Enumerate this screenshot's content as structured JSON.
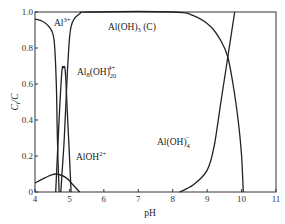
{
  "chart_data": {
    "type": "line",
    "title": "",
    "xlabel": "pH",
    "ylabel": "C_i / C",
    "xlim": [
      4,
      11
    ],
    "ylim": [
      0,
      1.0
    ],
    "x_ticks": [
      "4",
      "5",
      "6",
      "7",
      "8",
      "9",
      "10",
      "11"
    ],
    "y_ticks": [
      "0",
      "0.2",
      "0.4",
      "0.6",
      "0.8",
      "1.0"
    ],
    "grid": false,
    "legend": "none (inline curve labels)",
    "series": [
      {
        "name": "Al3+",
        "label_base": "Al",
        "label_sup": "3+",
        "points": [
          [
            4.0,
            0.96
          ],
          [
            4.2,
            0.95
          ],
          [
            4.4,
            0.92
          ],
          [
            4.55,
            0.85
          ],
          [
            4.62,
            0.6
          ],
          [
            4.65,
            0.3
          ],
          [
            4.7,
            0.0
          ]
        ]
      },
      {
        "name": "Al8(OH)20 4+",
        "label_base": "Al",
        "label_sub1": "8",
        "label_mid": "(OH)",
        "label_sub2": "20",
        "label_sup": "4+",
        "points": [
          [
            4.6,
            0.0
          ],
          [
            4.7,
            0.4
          ],
          [
            4.78,
            0.67
          ],
          [
            4.83,
            0.69
          ],
          [
            4.88,
            0.67
          ],
          [
            4.95,
            0.4
          ],
          [
            5.05,
            0.0
          ]
        ]
      },
      {
        "name": "AlOH2+",
        "label_base": "AlOH",
        "label_sup": "2+",
        "points": [
          [
            4.0,
            0.05
          ],
          [
            4.3,
            0.08
          ],
          [
            4.6,
            0.1
          ],
          [
            4.9,
            0.08
          ],
          [
            5.1,
            0.04
          ],
          [
            5.3,
            0.0
          ]
        ]
      },
      {
        "name": "Al(OH)3 (C)",
        "label_base": "Al(OH)",
        "label_sub": "3",
        "label_suffix": " (C)",
        "points": [
          [
            4.75,
            0.0
          ],
          [
            4.85,
            0.3
          ],
          [
            4.95,
            0.7
          ],
          [
            5.05,
            0.92
          ],
          [
            5.3,
            0.99
          ],
          [
            5.6,
            1.0
          ],
          [
            8.0,
            1.0
          ],
          [
            8.6,
            0.98
          ],
          [
            9.1,
            0.92
          ],
          [
            9.4,
            0.84
          ],
          [
            9.6,
            0.75
          ],
          [
            9.75,
            0.6
          ],
          [
            9.9,
            0.4
          ],
          [
            10.0,
            0.2
          ],
          [
            10.05,
            0.0
          ]
        ]
      },
      {
        "name": "Al(OH)4-",
        "label_base": "Al(OH)",
        "label_sub": "4",
        "label_sup": "−",
        "points": [
          [
            8.2,
            0.0
          ],
          [
            8.6,
            0.04
          ],
          [
            9.0,
            0.12
          ],
          [
            9.2,
            0.25
          ],
          [
            9.4,
            0.5
          ],
          [
            9.6,
            0.75
          ],
          [
            9.8,
            1.0
          ]
        ]
      }
    ]
  },
  "labels": {
    "x_axis": "pH",
    "y_axis_c": "C",
    "y_axis_i": "i",
    "y_axis_rest": "/C"
  }
}
